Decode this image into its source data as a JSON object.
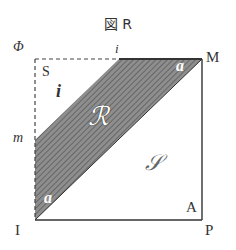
{
  "title": "図 R",
  "labels": {
    "phi": "Φ",
    "i_top": "i",
    "M": "M",
    "S": "S",
    "i_left": "i",
    "m": "m",
    "R_region": "ℛ",
    "S_region": "𝒮",
    "a_top": "a",
    "a_bottom": "a",
    "A": "A",
    "I": "I",
    "P": "P"
  },
  "colors": {
    "line": "#333333",
    "fill": "#8a8a8a",
    "hatch": "#5a5a5a"
  }
}
